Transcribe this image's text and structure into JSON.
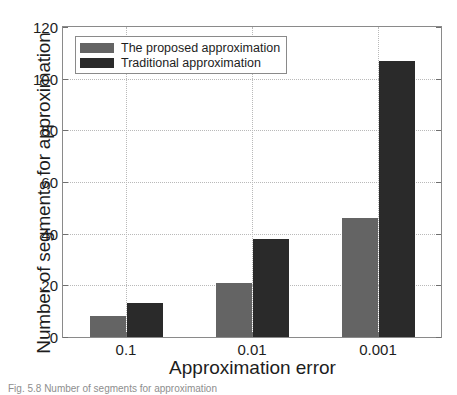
{
  "chart_data": {
    "type": "bar",
    "title": "",
    "xlabel": "Approximation error",
    "ylabel": "Number of segments for approximation",
    "categories": [
      "0.1",
      "0.01",
      "0.001"
    ],
    "series": [
      {
        "name": "The proposed approximation",
        "color": "#646464",
        "values": [
          8,
          21,
          46
        ]
      },
      {
        "name": "Traditional approximation",
        "color": "#2a2a2a",
        "values": [
          13,
          38,
          107
        ]
      }
    ],
    "ylim": [
      0,
      120
    ],
    "yticks": [
      0,
      20,
      40,
      60,
      80,
      100,
      120
    ],
    "ytick_labels": [
      "0",
      "20",
      "40",
      "60",
      "80",
      "100",
      "120"
    ],
    "grid": "dotted-both",
    "legend_position": "top-left"
  },
  "caption": "Fig. 5.8  Number of segments for approximation"
}
